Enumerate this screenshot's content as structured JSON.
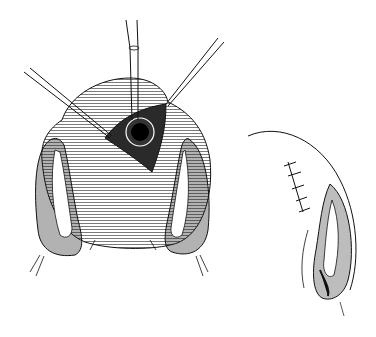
{
  "figure": {
    "background": "#ffffff",
    "ink": "#111111",
    "panels": [
      {
        "id": "left",
        "subject": "uterus-with-incision-and-forceps",
        "instruments": [
          "forceps-left",
          "probe-center",
          "forceps-right"
        ],
        "features": [
          "fundus",
          "incision-opening",
          "left-adnexa",
          "right-adnexa"
        ]
      },
      {
        "id": "right",
        "subject": "sutured-uterus-lateral-view",
        "features": [
          "suture-line",
          "adnexa"
        ],
        "suture_count": 5
      }
    ]
  }
}
